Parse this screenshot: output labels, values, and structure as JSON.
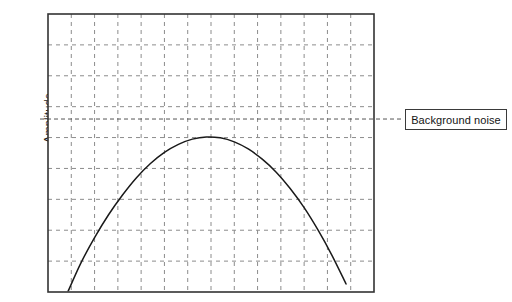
{
  "chart_data": {
    "type": "line",
    "title": "",
    "subtitle": "",
    "xlabel": "",
    "ylabel": "Amplitude",
    "grid": true,
    "grid_style": "dashed",
    "grid_color": "#8c8c8c",
    "frame_color": "#333333",
    "curve_color": "#1a1a1a",
    "axis_tick_labels": {
      "x": [],
      "y": []
    },
    "xlim": [
      0,
      14
    ],
    "ylim": [
      0,
      9
    ],
    "x_gridline_count": 13,
    "y_gridline_count": 8,
    "annotations": [
      {
        "name": "background-noise",
        "label": "Background noise",
        "type": "horizontal-threshold-line",
        "y_value": 5.6,
        "style": "dashed",
        "extends_outside_plot": true,
        "boxed": true
      }
    ],
    "series": [
      {
        "name": "signal",
        "style": "solid",
        "x": [
          0.85,
          1.4,
          2.0,
          2.6,
          3.2,
          3.8,
          4.4,
          5.0,
          5.6,
          6.2,
          6.8,
          7.4,
          8.0,
          8.6,
          9.2,
          9.8,
          10.4,
          11.0,
          11.6,
          12.2,
          12.8
        ],
        "y": [
          0.0,
          0.92,
          1.76,
          2.5,
          3.14,
          3.7,
          4.16,
          4.52,
          4.78,
          4.95,
          5.02,
          4.99,
          4.86,
          4.63,
          4.3,
          3.88,
          3.35,
          2.73,
          2.0,
          1.18,
          0.26
        ]
      }
    ],
    "peak": {
      "x": 6.8,
      "y": 5.02
    },
    "note": "Signal peak lies below the background noise threshold"
  },
  "axis": {
    "y_title": "Amplitude"
  },
  "legend": {
    "noise_label": "Background noise"
  },
  "colors": {
    "frame": "#333333",
    "grid": "#8c8c8c",
    "curve": "#1a1a1a",
    "label_border": "#3a3a3a",
    "text": "#141414",
    "background": "#ffffff"
  }
}
